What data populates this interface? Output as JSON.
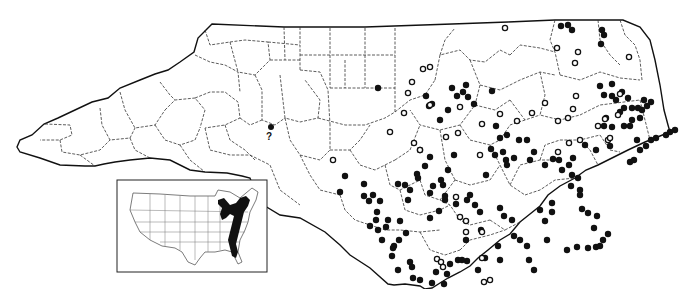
{
  "map": {
    "region": "North Carolina",
    "legend_symbols": {
      "filled_circle": "record (filled dot)",
      "open_circle": "record (open dot)",
      "question_mark": "?"
    },
    "uncertain_label": "?",
    "inset": {
      "region": "Conterminous United States",
      "range_color": "#111111",
      "range_description": "Eastern seaboard and Great Lakes range shaded black"
    },
    "colors": {
      "background": "#ffffff",
      "ink": "#111111"
    },
    "filled_points": [
      [
        378,
        88
      ],
      [
        466,
        85
      ],
      [
        492,
        91
      ],
      [
        432,
        104
      ],
      [
        440,
        120
      ],
      [
        420,
        150
      ],
      [
        496,
        126
      ],
      [
        500,
        138
      ],
      [
        507,
        135
      ],
      [
        486,
        175
      ],
      [
        454,
        155
      ],
      [
        433,
        186
      ],
      [
        441,
        180
      ],
      [
        448,
        170
      ],
      [
        425,
        166
      ],
      [
        417,
        174
      ],
      [
        418,
        178
      ],
      [
        430,
        193
      ],
      [
        410,
        190
      ],
      [
        439,
        211
      ],
      [
        430,
        218
      ],
      [
        410,
        262
      ],
      [
        392,
        256
      ],
      [
        406,
        233
      ],
      [
        400,
        221
      ],
      [
        399,
        240
      ],
      [
        373,
        195
      ],
      [
        380,
        201
      ],
      [
        376,
        220
      ],
      [
        388,
        220
      ],
      [
        386,
        227
      ],
      [
        378,
        230
      ],
      [
        382,
        240
      ],
      [
        393,
        248
      ],
      [
        443,
        185
      ],
      [
        445,
        200
      ],
      [
        445,
        196
      ],
      [
        456,
        204
      ],
      [
        467,
        200
      ],
      [
        470,
        195
      ],
      [
        475,
        205
      ],
      [
        480,
        212
      ],
      [
        500,
        208
      ],
      [
        504,
        216
      ],
      [
        512,
        220
      ],
      [
        514,
        236
      ],
      [
        520,
        240
      ],
      [
        527,
        246
      ],
      [
        529,
        260
      ],
      [
        534,
        270
      ],
      [
        498,
        246
      ],
      [
        500,
        260
      ],
      [
        485,
        258
      ],
      [
        478,
        270
      ],
      [
        467,
        261
      ],
      [
        458,
        260
      ],
      [
        466,
        240
      ],
      [
        481,
        230
      ],
      [
        552,
        203
      ],
      [
        552,
        212
      ],
      [
        540,
        210
      ],
      [
        545,
        221
      ],
      [
        547,
        240
      ],
      [
        567,
        250
      ],
      [
        577,
        247
      ],
      [
        588,
        248
      ],
      [
        594,
        228
      ],
      [
        596,
        247
      ],
      [
        600,
        246
      ],
      [
        603,
        240
      ],
      [
        608,
        234
      ],
      [
        450,
        264
      ],
      [
        444,
        284
      ],
      [
        432,
        283
      ],
      [
        436,
        272
      ],
      [
        447,
        274
      ],
      [
        462,
        260
      ],
      [
        398,
        270
      ],
      [
        412,
        267
      ],
      [
        413,
        278
      ],
      [
        420,
        280
      ],
      [
        414,
        290
      ],
      [
        561,
        26
      ],
      [
        568,
        25
      ],
      [
        572,
        30
      ],
      [
        602,
        30
      ],
      [
        604,
        35
      ],
      [
        601,
        44
      ],
      [
        612,
        84
      ],
      [
        600,
        86
      ],
      [
        604,
        95
      ],
      [
        612,
        96
      ],
      [
        616,
        100
      ],
      [
        622,
        92
      ],
      [
        624,
        108
      ],
      [
        628,
        98
      ],
      [
        632,
        108
      ],
      [
        620,
        112
      ],
      [
        606,
        118
      ],
      [
        604,
        126
      ],
      [
        612,
        127
      ],
      [
        624,
        126
      ],
      [
        630,
        126
      ],
      [
        637,
        140
      ],
      [
        610,
        146
      ],
      [
        596,
        150
      ],
      [
        585,
        145
      ],
      [
        573,
        158
      ],
      [
        569,
        165
      ],
      [
        632,
        120
      ],
      [
        640,
        118
      ],
      [
        642,
        110
      ],
      [
        647,
        106
      ],
      [
        651,
        102
      ],
      [
        644,
        100
      ],
      [
        638,
        108
      ],
      [
        553,
        159
      ],
      [
        559,
        160
      ],
      [
        562,
        170
      ],
      [
        572,
        175
      ],
      [
        578,
        178
      ],
      [
        571,
        186
      ],
      [
        580,
        190
      ],
      [
        580,
        195
      ],
      [
        582,
        209
      ],
      [
        588,
        213
      ],
      [
        597,
        216
      ],
      [
        630,
        162
      ],
      [
        634,
        160
      ],
      [
        640,
        150
      ],
      [
        646,
        146
      ],
      [
        651,
        140
      ],
      [
        656,
        138
      ],
      [
        666,
        135
      ],
      [
        670,
        132
      ],
      [
        675,
        130
      ],
      [
        364,
        184
      ],
      [
        364,
        196
      ],
      [
        369,
        201
      ],
      [
        377,
        212
      ],
      [
        370,
        226
      ],
      [
        394,
        246
      ],
      [
        398,
        184
      ],
      [
        405,
        185
      ],
      [
        408,
        200
      ],
      [
        430,
        157
      ],
      [
        340,
        192
      ],
      [
        345,
        176
      ],
      [
        426,
        96
      ],
      [
        429,
        106
      ],
      [
        448,
        110
      ],
      [
        452,
        88
      ],
      [
        457,
        96
      ],
      [
        463,
        92
      ],
      [
        468,
        97
      ],
      [
        474,
        104
      ],
      [
        491,
        149
      ],
      [
        495,
        155
      ],
      [
        503,
        152
      ],
      [
        506,
        160
      ],
      [
        514,
        158
      ],
      [
        507,
        165
      ],
      [
        519,
        140
      ],
      [
        527,
        140
      ],
      [
        534,
        152
      ],
      [
        530,
        160
      ],
      [
        545,
        165
      ]
    ],
    "open_points": [
      [
        505,
        28
      ],
      [
        557,
        48
      ],
      [
        578,
        52
      ],
      [
        575,
        63
      ],
      [
        629,
        57
      ],
      [
        423,
        69
      ],
      [
        430,
        67
      ],
      [
        412,
        82
      ],
      [
        408,
        93
      ],
      [
        404,
        113
      ],
      [
        390,
        132
      ],
      [
        430,
        105
      ],
      [
        460,
        107
      ],
      [
        576,
        96
      ],
      [
        573,
        109
      ],
      [
        482,
        124
      ],
      [
        500,
        114
      ],
      [
        517,
        121
      ],
      [
        532,
        113
      ],
      [
        558,
        121
      ],
      [
        568,
        118
      ],
      [
        545,
        103
      ],
      [
        333,
        160
      ],
      [
        414,
        143
      ],
      [
        420,
        150
      ],
      [
        446,
        137
      ],
      [
        458,
        133
      ],
      [
        480,
        155
      ],
      [
        456,
        197
      ],
      [
        460,
        217
      ],
      [
        466,
        221
      ],
      [
        466,
        232
      ],
      [
        482,
        258
      ],
      [
        484,
        282
      ],
      [
        490,
        280
      ],
      [
        495,
        296
      ],
      [
        437,
        259
      ],
      [
        441,
        262
      ],
      [
        443,
        267
      ],
      [
        482,
        232
      ],
      [
        558,
        152
      ],
      [
        569,
        143
      ],
      [
        605,
        119
      ],
      [
        620,
        94
      ],
      [
        618,
        115
      ],
      [
        608,
        140
      ],
      [
        598,
        126
      ],
      [
        580,
        140
      ],
      [
        610,
        138
      ]
    ],
    "uncertain_point": [
      264,
      128
    ]
  }
}
